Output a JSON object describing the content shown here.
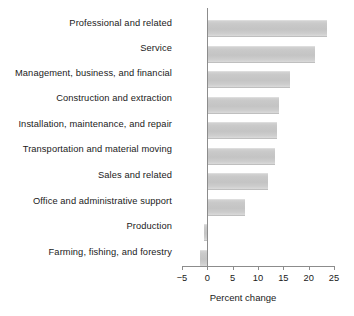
{
  "chart_data": {
    "type": "bar",
    "orientation": "horizontal",
    "title": "",
    "xlabel": "Percent change",
    "ylabel": "",
    "xlim": [
      -5,
      25
    ],
    "xticks": [
      -5,
      0,
      5,
      10,
      15,
      20,
      25
    ],
    "xtick_labels": [
      "−5",
      "0",
      "5",
      "10",
      "15",
      "20",
      "25"
    ],
    "grid": false,
    "legend": null,
    "bar_color": "#c8c8c8",
    "axis_color": "#8c8c8c",
    "categories": [
      "Professional and related",
      "Service",
      "Management, business, and financial",
      "Construction and extraction",
      "Installation, maintenance, and repair",
      "Transportation and material moving",
      "Sales and related",
      "Office and administrative support",
      "Production",
      "Farming, fishing, and forestry"
    ],
    "values": [
      23.7,
      21.3,
      16.3,
      14.1,
      13.7,
      13.3,
      12.0,
      7.4,
      -0.7,
      -1.5
    ]
  }
}
